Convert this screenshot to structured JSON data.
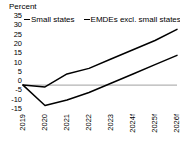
{
  "chart_data": {
    "type": "line",
    "title": "",
    "ylabel": "Percent",
    "xlabel": "",
    "ylim": [
      -15,
      35
    ],
    "yticks": [
      35,
      30,
      25,
      20,
      15,
      10,
      5,
      0,
      -5,
      -10,
      -15
    ],
    "grid": false,
    "zero_line": true,
    "legend_position": "top",
    "categories": [
      "2019",
      "2020",
      "2021",
      "2022",
      "2023",
      "2024f",
      "2025f",
      "2026f"
    ],
    "series": [
      {
        "name": "Small states",
        "color": "#000000",
        "values": [
          0,
          -11,
          -8,
          -4,
          1,
          6,
          11,
          16
        ]
      },
      {
        "name": "EMDEs excl. small states",
        "color": "#000000",
        "values": [
          0,
          -1,
          6,
          9,
          14,
          19,
          24,
          30
        ]
      }
    ]
  },
  "axis": {
    "unit_label": "Percent"
  },
  "legend": {
    "items": [
      {
        "label": "Small states",
        "color": "#000000"
      },
      {
        "label": "EMDEs excl. small states",
        "color": "#000000"
      }
    ]
  },
  "colors": {
    "zero_line": "#b3b3b3",
    "text": "#000000",
    "background": "#ffffff"
  }
}
